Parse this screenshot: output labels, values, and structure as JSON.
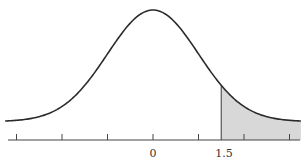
{
  "chart_data": {
    "type": "area",
    "title": "",
    "xlabel": "",
    "ylabel": "",
    "x_tick_labels": [
      {
        "value": 0,
        "label": "0"
      },
      {
        "value": 1.5,
        "label": "1.5"
      }
    ],
    "x_ticks": [
      -3,
      -2,
      -1,
      0,
      1,
      2,
      3
    ],
    "xlim": [
      -3.25,
      3.25
    ],
    "shaded_region": {
      "from": 1.5,
      "to": 3.25,
      "color": "#d8d8d8"
    },
    "curve": "normal pdf, mean 0, sd 1",
    "grid": false,
    "legend": "none"
  },
  "labels": {
    "zero": "0",
    "boundary": "1.5"
  },
  "colors": {
    "curve": "#2a2a2a",
    "axis": "#444444",
    "shade": "#d9d9d9"
  }
}
